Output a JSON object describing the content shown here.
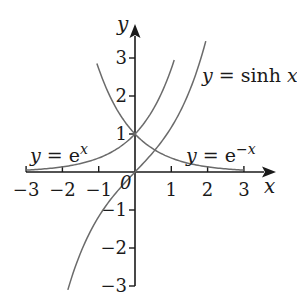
{
  "figure": {
    "axes": {
      "x_label": "x",
      "y_label": "y",
      "origin_label": "0",
      "x_ticks": [
        {
          "value": -3,
          "label": "−3"
        },
        {
          "value": -2,
          "label": "−2"
        },
        {
          "value": -1,
          "label": "−1"
        },
        {
          "value": 1,
          "label": "1"
        },
        {
          "value": 2,
          "label": "2"
        },
        {
          "value": 3,
          "label": "3"
        }
      ],
      "y_ticks": [
        {
          "value": 3,
          "label": "3"
        },
        {
          "value": 2,
          "label": "2"
        },
        {
          "value": 1,
          "label": "1"
        },
        {
          "value": -1,
          "label": "−1"
        },
        {
          "value": -2,
          "label": "−2"
        },
        {
          "value": -3,
          "label": "−3"
        }
      ],
      "x_range": [
        -3,
        3
      ],
      "y_range": [
        -3,
        3
      ]
    },
    "curves": [
      {
        "id": "exp",
        "label_lhs": "y",
        "label_eq": " = ",
        "label_base": "e",
        "label_sup": "x",
        "label_plain": "y = e^x",
        "x_domain": [
          -3,
          1.08
        ]
      },
      {
        "id": "exp-neg",
        "label_lhs": "y",
        "label_eq": " = ",
        "label_base": "e",
        "label_sup": "−x",
        "label_plain": "y = e^−x",
        "x_domain": [
          -1.05,
          3
        ]
      },
      {
        "id": "sinh",
        "label_lhs": "y",
        "label_eq": " = ",
        "label_fn": "sinh",
        "label_var": "x",
        "label_plain": "y = sinh x",
        "x_domain": [
          -1.85,
          1.95
        ]
      }
    ],
    "colors": {
      "axis": "#1a1a1a",
      "curve": "#6b6b6b",
      "text": "#1a1a1a"
    }
  }
}
